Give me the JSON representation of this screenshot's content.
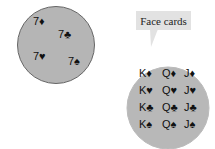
{
  "left_set": {
    "colors": {
      "fill": "#b5b5b5",
      "stroke": "#666666"
    },
    "cards": [
      {
        "label": "7♦",
        "x": 33,
        "y": 16
      },
      {
        "label": "7♣",
        "x": 58,
        "y": 29
      },
      {
        "label": "7♥",
        "x": 33,
        "y": 51
      },
      {
        "label": "7♠",
        "x": 68,
        "y": 56
      }
    ]
  },
  "right_set": {
    "callout": "Face cards",
    "cards": [
      {
        "label": "K♦",
        "x": 139,
        "y": 68
      },
      {
        "label": "Q♦",
        "x": 162,
        "y": 68
      },
      {
        "label": "J♦",
        "x": 184,
        "y": 68
      },
      {
        "label": "K♥",
        "x": 139,
        "y": 85
      },
      {
        "label": "Q♥",
        "x": 162,
        "y": 85
      },
      {
        "label": "J♥",
        "x": 184,
        "y": 85
      },
      {
        "label": "K♣",
        "x": 139,
        "y": 102
      },
      {
        "label": "Q♣",
        "x": 162,
        "y": 102
      },
      {
        "label": "J♣",
        "x": 184,
        "y": 102
      },
      {
        "label": "K♠",
        "x": 139,
        "y": 119
      },
      {
        "label": "Q♠",
        "x": 162,
        "y": 119
      },
      {
        "label": "J♠",
        "x": 184,
        "y": 119
      }
    ]
  }
}
